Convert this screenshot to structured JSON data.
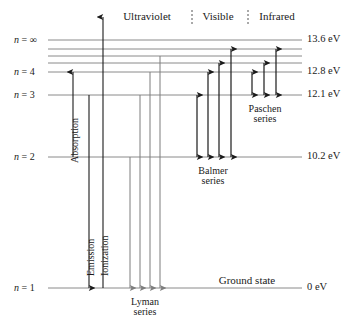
{
  "diagram": {
    "colors": {
      "level_line": "#8a8a8a",
      "arrow_dark": "#1a1a1a",
      "arrow_gray": "#7d7d7d",
      "text": "#1a1a1a",
      "background": "#ffffff"
    },
    "levels": [
      {
        "name": "n-infinity",
        "label_n": "n",
        "label_eq": "=",
        "label_value": "∞",
        "energy": "13.6 eV",
        "y": 40
      },
      {
        "name": "n-7",
        "label_n": "",
        "label_eq": "",
        "label_value": "",
        "energy": "",
        "y": 49
      },
      {
        "name": "n-6",
        "label_n": "",
        "label_eq": "",
        "label_value": "",
        "energy": "",
        "y": 56
      },
      {
        "name": "n-5",
        "label_n": "",
        "label_eq": "",
        "label_value": "",
        "energy": "",
        "y": 63
      },
      {
        "name": "n-4",
        "label_n": "n",
        "label_eq": "=",
        "label_value": "4",
        "energy": "12.8 eV",
        "y": 72
      },
      {
        "name": "n-3",
        "label_n": "n",
        "label_eq": "=",
        "label_value": "3",
        "energy": "12.1 eV",
        "y": 95
      },
      {
        "name": "n-2",
        "label_n": "n",
        "label_eq": "=",
        "label_value": "2",
        "energy": "10.2 eV",
        "y": 157
      },
      {
        "name": "n-1",
        "label_n": "n",
        "label_eq": "=",
        "label_value": "1",
        "energy": "0 eV",
        "y": 288
      }
    ],
    "bands": [
      {
        "name": "ultraviolet",
        "label": "Ultraviolet",
        "x": 147,
        "y": 18
      },
      {
        "name": "visible",
        "label": "Visible",
        "x": 218,
        "y": 18
      },
      {
        "name": "infrared",
        "label": "Infrared",
        "x": 277,
        "y": 18
      }
    ],
    "band_dividers": [
      {
        "name": "divider-uv-visible",
        "x": 192
      },
      {
        "name": "divider-visible-infrared",
        "x": 248
      }
    ],
    "process_arrows": [
      {
        "name": "absorption",
        "label": "Absorption",
        "x": 73,
        "from_y": 157,
        "to_y": 72,
        "direction": "up",
        "label_x": 70,
        "label_y": 163
      },
      {
        "name": "emission",
        "label": "Emission",
        "x": 89,
        "from_y": 95,
        "to_y": 288,
        "direction": "down",
        "label_x": 86,
        "label_y": 276
      },
      {
        "name": "ionization",
        "label": "Ionization",
        "x": 103,
        "from_y": 288,
        "to_y": 17,
        "direction": "up",
        "label_x": 100,
        "label_y": 276
      }
    ],
    "series": [
      {
        "name": "lyman-series",
        "label_line1": "Lyman",
        "label_line2": "series",
        "label_x": 145,
        "label_y": 297,
        "baseline_y": 288,
        "arrows": [
          {
            "x": 130,
            "top_y": 157
          },
          {
            "x": 140,
            "top_y": 95
          },
          {
            "x": 150,
            "top_y": 72
          },
          {
            "x": 160,
            "top_y": 56
          }
        ]
      },
      {
        "name": "balmer-series",
        "label_line1": "Balmer",
        "label_line2": "series",
        "label_x": 213,
        "label_y": 166,
        "baseline_y": 157,
        "arrows": [
          {
            "x": 197,
            "top_y": 95
          },
          {
            "x": 208,
            "top_y": 72
          },
          {
            "x": 219,
            "top_y": 63
          },
          {
            "x": 231,
            "top_y": 49
          }
        ]
      },
      {
        "name": "paschen-series",
        "label_line1": "Paschen",
        "label_line2": "series",
        "label_x": 265,
        "label_y": 104,
        "baseline_y": 95,
        "arrows": [
          {
            "x": 252,
            "top_y": 72
          },
          {
            "x": 264,
            "top_y": 63
          },
          {
            "x": 276,
            "top_y": 49
          }
        ]
      }
    ],
    "ground_state": {
      "label": "Ground state",
      "x": 247,
      "y": 282
    },
    "geometry": {
      "line_x_start": 48,
      "line_x_end": 302,
      "ev_label_x": 307
    }
  }
}
